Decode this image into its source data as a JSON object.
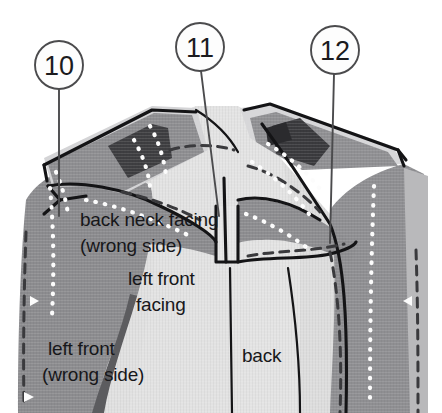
{
  "figure": {
    "width": 442,
    "height": 413,
    "background_color": "#ffffff"
  },
  "callouts": [
    {
      "id": "callout-10",
      "number": "10",
      "circle": {
        "cx": 59,
        "cy": 65,
        "r": 24
      },
      "leader": {
        "x1": 59,
        "y1": 89,
        "x2": 59,
        "y2": 216
      }
    },
    {
      "id": "callout-11",
      "number": "11",
      "circle": {
        "cx": 200,
        "cy": 47,
        "r": 24
      },
      "leader": {
        "x1": 201,
        "y1": 71,
        "x2": 219,
        "y2": 216
      }
    },
    {
      "id": "callout-12",
      "number": "12",
      "circle": {
        "cx": 335,
        "cy": 50,
        "r": 24
      },
      "leader": {
        "x1": 334,
        "y1": 74,
        "x2": 330,
        "y2": 243
      }
    }
  ],
  "labels": [
    {
      "id": "label-back-neck-facing",
      "name": "back-neck-facing",
      "lines": [
        "back neck facing",
        "(wrong side)"
      ],
      "x": 80,
      "y": 226,
      "line_height": 26
    },
    {
      "id": "label-left-front-facing",
      "name": "left-front-facing",
      "lines": [
        "left front",
        "facing"
      ],
      "x": 128,
      "y": 285,
      "line_height": 26
    },
    {
      "id": "label-left-front",
      "name": "left-front-wrong-side",
      "lines": [
        "left front",
        "(wrong side)"
      ],
      "x": 48,
      "y": 355,
      "line_height": 26
    },
    {
      "id": "label-back",
      "name": "back",
      "lines": [
        "back"
      ],
      "x": 242,
      "y": 362,
      "line_height": 26
    }
  ],
  "colors": {
    "paper": "#ffffff",
    "fabric_mid_gray": "#8e8e90",
    "fabric_mid_gray_2": "#97979a",
    "fabric_light": "#e2e2e2",
    "fabric_light_2": "#d6d6d6",
    "fabric_pale": "#ebebeb",
    "fabric_dark": "#3c3c3e",
    "fabric_dark_2": "#4e4e50",
    "outline_black": "#141416",
    "stitch_white": "#fdfdfd",
    "stitch_dark": "#38383a",
    "callout_stroke": "#4b4b4d",
    "text": "#17171a"
  },
  "legend_keys": [
    "solid black line = seam / cut edge",
    "white dotted line = basted stitching on dark fabric",
    "dark dashed line = stitching line on light fabric"
  ],
  "diagram_parts": [
    "left front (wrong side)",
    "left front facing",
    "back neck facing (wrong side)",
    "back"
  ]
}
